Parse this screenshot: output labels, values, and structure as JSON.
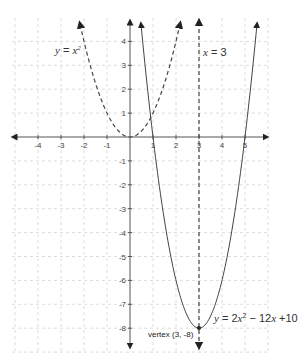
{
  "chart_data": {
    "type": "line",
    "title": "",
    "xlabel": "",
    "ylabel": "",
    "xlim": [
      -5,
      6
    ],
    "ylim": [
      -8.8,
      4.9
    ],
    "grid": true,
    "x_ticks": [
      -4,
      -3,
      -2,
      -1,
      1,
      2,
      3,
      4,
      5
    ],
    "y_ticks": [
      4,
      3,
      2,
      1,
      -1,
      -2,
      -3,
      -4,
      -5,
      -6,
      -7,
      -8
    ],
    "series": [
      {
        "name": "y = x²",
        "style": "dashed",
        "equation": "x^2",
        "x_range": [
          -2.17,
          2.17
        ],
        "x": [
          -2,
          -1,
          0,
          1,
          2
        ],
        "values": [
          4,
          1,
          0,
          1,
          4
        ]
      },
      {
        "name": "y = 2x² − 12x + 10",
        "style": "solid",
        "equation": "2x^2-12x+10",
        "x_range": [
          0.48,
          5.52
        ],
        "x": [
          1,
          2,
          3,
          4,
          5
        ],
        "values": [
          0,
          -6,
          -8,
          -6,
          0
        ]
      },
      {
        "name": "x = 3",
        "style": "dashed",
        "type": "vertical_line",
        "x": 3
      }
    ],
    "annotations": [
      {
        "text": "vertex (3, -8)",
        "x": 3,
        "y": -8
      }
    ]
  },
  "labels": {
    "parabola_basic": {
      "y": "y",
      "eq": " = ",
      "x": "x",
      "exp": "2"
    },
    "axis_of_symmetry": {
      "x": "x",
      "eq": " = 3"
    },
    "parabola_main": {
      "y": "y",
      "mid": " = 2",
      "x1": "x",
      "exp": "2",
      "mid2": " − 12",
      "x2": "x",
      "end": " +10"
    },
    "vertex": "vertex (3, -8)"
  },
  "ticks": {
    "x": [
      "-4",
      "-3",
      "-2",
      "-1",
      "1",
      "2",
      "3",
      "4",
      "5"
    ],
    "y": [
      "4",
      "3",
      "2",
      "1",
      "-1",
      "-2",
      "-3",
      "-4",
      "-5",
      "-6",
      "-7",
      "-8"
    ]
  },
  "colors": {
    "axis": "#555555",
    "curve": "#444444",
    "grid": "#dcdcdc"
  }
}
